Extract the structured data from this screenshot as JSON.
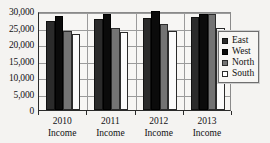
{
  "chart_data": {
    "type": "bar",
    "title": "",
    "xlabel": "",
    "ylabel": "",
    "categories": [
      "2010 Income",
      "2011 Income",
      "2012 Income",
      "2013 Income"
    ],
    "category_lines": [
      [
        "2010",
        "Income"
      ],
      [
        "2011",
        "Income"
      ],
      [
        "2012",
        "Income"
      ],
      [
        "2013",
        "Income"
      ]
    ],
    "series": [
      {
        "name": "East",
        "color": "#2b2b2b",
        "values": [
          27000,
          27500,
          28000,
          28300
        ]
      },
      {
        "name": "West",
        "color": "#0b0b0b",
        "values": [
          28500,
          29000,
          30000,
          29000
        ]
      },
      {
        "name": "North",
        "color": "#737373",
        "values": [
          24000,
          25000,
          26000,
          29000
        ]
      },
      {
        "name": "South",
        "color": "#fbfbfb",
        "values": [
          23000,
          23700,
          24000,
          25000
        ]
      }
    ],
    "ylim": [
      0,
      30000
    ],
    "ytick_values": [
      0,
      5000,
      10000,
      15000,
      20000,
      25000,
      30000
    ],
    "ytick_labels": [
      "0",
      "5,000",
      "10,000",
      "15,000",
      "20,000",
      "25,000",
      "30,000"
    ],
    "grid": true,
    "legend_position": "right",
    "legend_entries": [
      "East",
      "West",
      "North",
      "South"
    ]
  }
}
